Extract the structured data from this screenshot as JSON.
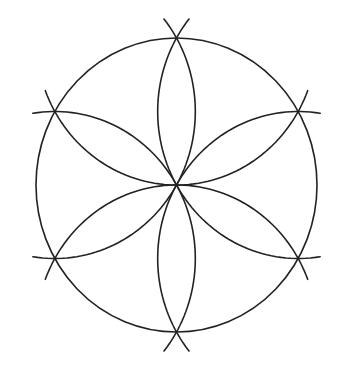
{
  "diagram": {
    "title": "",
    "type": "hexafoil rosette (six-petal compass construction)",
    "stroke_color": "#222222",
    "background": "#ffffff",
    "circle": {
      "cx": 176.5,
      "cy": 185,
      "rx": 140.5,
      "ry": 147
    },
    "vertices": [
      {
        "name": "top",
        "angle_deg": -90
      },
      {
        "name": "upper-right",
        "angle_deg": -30
      },
      {
        "name": "lower-right",
        "angle_deg": 30
      },
      {
        "name": "bottom",
        "angle_deg": 90
      },
      {
        "name": "lower-left",
        "angle_deg": 150
      },
      {
        "name": "upper-left",
        "angle_deg": 210
      }
    ],
    "petal_count": 6,
    "arc_overshoot_deg": 9
  }
}
